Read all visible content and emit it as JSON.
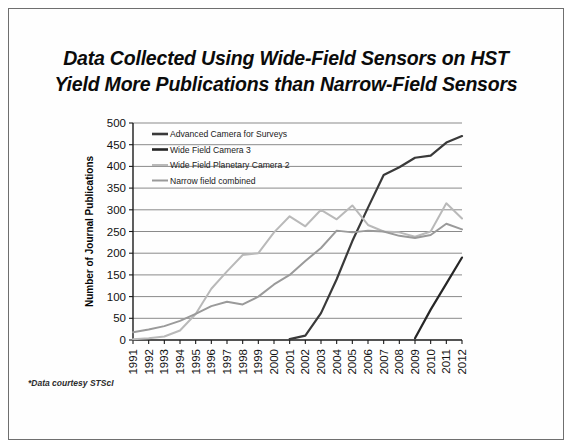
{
  "slide": {
    "title": "Data Collected Using Wide-Field Sensors on HST\nYield More Publications than Narrow-Field Sensors",
    "footnote": "*Data courtesy STScI",
    "border_color": "#6f6f6f",
    "background_color": "#ffffff"
  },
  "chart_data": {
    "type": "line",
    "title": "Data Collected Using Wide-Field Sensors on HST Yield More Publications than Narrow-Field Sensors",
    "xlabel": "",
    "ylabel": "Number of Journal Publications",
    "ylim": [
      0,
      500
    ],
    "ytick_step": 50,
    "yticks": [
      0,
      50,
      100,
      150,
      200,
      250,
      300,
      350,
      400,
      450,
      500
    ],
    "grid": true,
    "legend_position": "top-left-inside",
    "categories": [
      "1991",
      "1992",
      "1993",
      "1994",
      "1995",
      "1996",
      "1997",
      "1998",
      "1999",
      "2000",
      "2001",
      "2002",
      "2003",
      "2004",
      "2005",
      "2006",
      "2007",
      "2008",
      "2009",
      "2010",
      "2011",
      "2012"
    ],
    "series": [
      {
        "name": "Advanced Camera for Surveys",
        "color": "#3a3a3a",
        "width": 2.2,
        "values": [
          null,
          null,
          null,
          null,
          null,
          null,
          null,
          null,
          null,
          null,
          2,
          10,
          62,
          140,
          228,
          305,
          380,
          398,
          420,
          425,
          455,
          470
        ]
      },
      {
        "name": "Wide Field Camera 3",
        "color": "#262626",
        "width": 2.2,
        "values": [
          null,
          null,
          null,
          null,
          null,
          null,
          null,
          null,
          null,
          null,
          null,
          null,
          null,
          null,
          null,
          null,
          null,
          null,
          4,
          70,
          130,
          190
        ]
      },
      {
        "name": "Wide Field Planetary Camera 2",
        "color": "#b9b9b9",
        "width": 2.0,
        "values": [
          2,
          4,
          8,
          22,
          60,
          118,
          158,
          196,
          200,
          248,
          285,
          262,
          300,
          278,
          310,
          265,
          250,
          248,
          238,
          250,
          315,
          280
        ]
      },
      {
        "name": "Narrow field combined",
        "color": "#9a9a9a",
        "width": 2.0,
        "values": [
          18,
          24,
          32,
          44,
          60,
          78,
          88,
          82,
          100,
          128,
          150,
          182,
          212,
          252,
          248,
          252,
          250,
          240,
          235,
          242,
          268,
          255
        ]
      }
    ]
  },
  "legend": {
    "items": [
      {
        "label": "Advanced Camera for Surveys",
        "color": "#3a3a3a",
        "width": 2.6
      },
      {
        "label": "Wide Field Camera 3",
        "color": "#262626",
        "width": 2.6
      },
      {
        "label": "Wide Field Planetary Camera 2",
        "color": "#b9b9b9",
        "width": 2.0
      },
      {
        "label": "Narrow field combined",
        "color": "#9a9a9a",
        "width": 2.0
      }
    ]
  }
}
